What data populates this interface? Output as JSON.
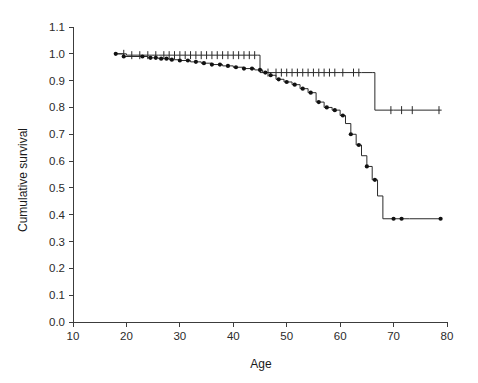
{
  "figure": {
    "title": "",
    "background_color": "#ffffff",
    "line_color": "#2a2a2a",
    "marker_color": "#111111",
    "axis_color": "#3c3c3c"
  },
  "chart_data": {
    "type": "line",
    "subtype": "kaplan-meier-step",
    "title": "",
    "subtitle": "",
    "xlabel": "Age",
    "ylabel": "Cumulative survival",
    "xlim": [
      10,
      80
    ],
    "ylim": [
      0.0,
      1.1
    ],
    "xticks": [
      10,
      20,
      30,
      40,
      50,
      60,
      70,
      80
    ],
    "xtick_labels": [
      "10",
      "20",
      "30",
      "40",
      "50",
      "60",
      "70",
      "80"
    ],
    "yticks": [
      0.0,
      0.1,
      0.2,
      0.3,
      0.4,
      0.5,
      0.6,
      0.7,
      0.8,
      0.9,
      1.0,
      1.1
    ],
    "ytick_labels": [
      "0.0",
      "0.1",
      "0.2",
      "0.3",
      "0.4",
      "0.5",
      "0.6",
      "0.7",
      "0.8",
      "0.9",
      "1.0",
      "1.1"
    ],
    "grid": false,
    "legend": null,
    "legend_position": "none",
    "annotations": [],
    "series": [
      {
        "name": "upper-curve",
        "marker": "plus-tick",
        "marker_label": "censored",
        "points": [
          [
            18.0,
            1.0
          ],
          [
            20.0,
            0.995
          ],
          [
            22.0,
            0.995
          ],
          [
            24.0,
            0.995
          ],
          [
            26.0,
            0.995
          ],
          [
            28.0,
            0.995
          ],
          [
            30.0,
            0.995
          ],
          [
            32.0,
            0.995
          ],
          [
            34.0,
            0.995
          ],
          [
            36.0,
            0.995
          ],
          [
            38.0,
            0.995
          ],
          [
            40.0,
            0.995
          ],
          [
            42.0,
            0.995
          ],
          [
            44.0,
            0.995
          ],
          [
            44.5,
            0.995
          ],
          [
            45.0,
            0.93
          ],
          [
            48.0,
            0.93
          ],
          [
            52.0,
            0.93
          ],
          [
            56.0,
            0.93
          ],
          [
            60.0,
            0.93
          ],
          [
            64.0,
            0.93
          ],
          [
            66.0,
            0.93
          ],
          [
            66.5,
            0.79
          ],
          [
            70.0,
            0.79
          ],
          [
            74.0,
            0.79
          ],
          [
            79.0,
            0.79
          ]
        ],
        "censor_ages": [
          19.5,
          21.0,
          22.5,
          24.0,
          25.5,
          27.0,
          28.0,
          29.0,
          30.0,
          31.0,
          32.0,
          33.0,
          34.0,
          35.0,
          36.0,
          37.0,
          38.0,
          39.0,
          40.0,
          41.0,
          42.0,
          43.0,
          44.0,
          46.5,
          48.0,
          49.0,
          50.0,
          51.0,
          52.0,
          53.0,
          54.0,
          55.0,
          56.0,
          57.0,
          58.0,
          59.0,
          60.5,
          62.5,
          63.5,
          69.5,
          71.5,
          73.5,
          78.5
        ],
        "steps": [
          {
            "age": 44.6,
            "from": 0.995,
            "to": 0.93
          },
          {
            "age": 66.6,
            "from": 0.93,
            "to": 0.79
          }
        ]
      },
      {
        "name": "lower-curve",
        "marker": "filled-diamond",
        "marker_label": "censored",
        "points": [
          [
            18.0,
            1.0
          ],
          [
            19.5,
            0.99
          ],
          [
            24.0,
            0.985
          ],
          [
            26.0,
            0.982
          ],
          [
            28.0,
            0.978
          ],
          [
            30.0,
            0.975
          ],
          [
            32.0,
            0.97
          ],
          [
            34.0,
            0.965
          ],
          [
            36.0,
            0.96
          ],
          [
            38.0,
            0.955
          ],
          [
            40.0,
            0.95
          ],
          [
            42.0,
            0.945
          ],
          [
            44.0,
            0.94
          ],
          [
            45.5,
            0.93
          ],
          [
            47.0,
            0.92
          ],
          [
            48.0,
            0.905
          ],
          [
            49.5,
            0.895
          ],
          [
            51.0,
            0.885
          ],
          [
            52.5,
            0.87
          ],
          [
            54.0,
            0.855
          ],
          [
            55.5,
            0.82
          ],
          [
            57.0,
            0.8
          ],
          [
            58.5,
            0.79
          ],
          [
            60.0,
            0.77
          ],
          [
            61.0,
            0.74
          ],
          [
            62.0,
            0.7
          ],
          [
            63.0,
            0.66
          ],
          [
            64.0,
            0.62
          ],
          [
            65.0,
            0.58
          ],
          [
            66.0,
            0.53
          ],
          [
            67.0,
            0.47
          ],
          [
            68.0,
            0.385
          ],
          [
            73.0,
            0.385
          ],
          [
            79.0,
            0.385
          ]
        ],
        "censor_ages": [
          18.0,
          19.5,
          23.0,
          24.5,
          25.5,
          26.5,
          27.5,
          28.5,
          30.0,
          31.5,
          33.0,
          34.5,
          36.0,
          37.5,
          39.0,
          40.5,
          42.0,
          43.5,
          45.0,
          46.0,
          47.0,
          48.5,
          50.0,
          51.5,
          53.0,
          54.5,
          56.0,
          57.5,
          59.0,
          60.5,
          62.0,
          63.5,
          65.0,
          66.5,
          70.0,
          71.5,
          78.8
        ]
      }
    ]
  }
}
